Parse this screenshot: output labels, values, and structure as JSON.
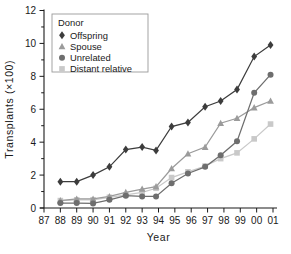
{
  "chart_data": {
    "type": "line",
    "title": "",
    "xlabel": "Year",
    "ylabel": "Transplants (×100)",
    "xtick_labels": [
      "87",
      "88",
      "89",
      "90",
      "91",
      "92",
      "93",
      "94",
      "95",
      "96",
      "97",
      "98",
      "99",
      "00",
      "01"
    ],
    "ytick_labels": [
      "0",
      "2",
      "4",
      "6",
      "8",
      "10",
      "12"
    ],
    "ylim": [
      0,
      12
    ],
    "xlim": [
      87,
      101
    ],
    "grid": false,
    "legend_position": "top-left",
    "legend_title": "Donor",
    "x": [
      88,
      89,
      90,
      91,
      92,
      93,
      93.85,
      94.8,
      95.8,
      96.85,
      97.8,
      98.8,
      99.85,
      100.85
    ],
    "series": [
      {
        "name": "Offspring",
        "marker": "diamond",
        "color": "#3c3c3c",
        "values": [
          1.6,
          1.6,
          2.0,
          2.5,
          3.55,
          3.7,
          3.5,
          4.95,
          5.2,
          6.15,
          6.5,
          7.2,
          9.2,
          9.9
        ]
      },
      {
        "name": "Spouse",
        "marker": "triangle",
        "color": "#9b9b9b",
        "values": [
          0.45,
          0.55,
          0.55,
          0.7,
          0.95,
          1.15,
          1.3,
          2.4,
          3.3,
          3.7,
          5.15,
          5.45,
          6.1,
          6.5
        ]
      },
      {
        "name": "Unrelated",
        "marker": "circle",
        "color": "#6e6e6e",
        "values": [
          0.3,
          0.3,
          0.28,
          0.5,
          0.75,
          0.7,
          0.7,
          1.5,
          2.1,
          2.5,
          3.2,
          4.05,
          7.0,
          8.1
        ]
      },
      {
        "name": "Distant relative",
        "marker": "square",
        "color": "#c9c9c9",
        "values": [
          0.45,
          0.5,
          0.5,
          0.65,
          0.8,
          0.95,
          1.2,
          1.85,
          2.2,
          2.55,
          3.0,
          3.35,
          4.2,
          5.1
        ]
      }
    ]
  }
}
